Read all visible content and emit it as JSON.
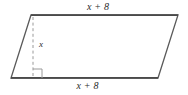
{
  "figure": {
    "kind": "parallelogram-with-height",
    "labels": {
      "top_side": "x + 8",
      "bottom_side": "x + 8",
      "height": "x"
    },
    "colors": {
      "stroke": "#5a5a5a",
      "outline_dark": "#4a4a4a",
      "dashed": "#9a9a9a",
      "background": "#ffffff",
      "text": "#2b2b2b"
    },
    "geometry": {
      "top_left": [
        31,
        15
      ],
      "top_right": [
        178,
        15
      ],
      "bottom_right": [
        158,
        78
      ],
      "bottom_left": [
        11,
        78
      ],
      "height_line_x": 33,
      "height_line_top_y": 17,
      "height_line_bottom_y": 78,
      "right_angle_size": 9
    }
  }
}
